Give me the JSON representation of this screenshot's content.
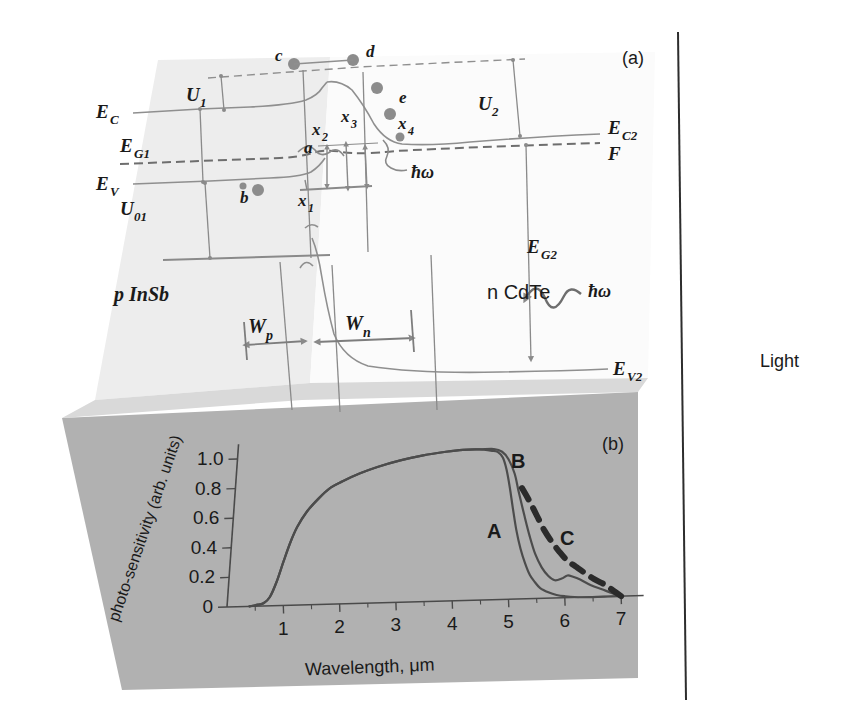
{
  "figure": {
    "panel_a_tag": "(a)",
    "panel_b_tag": "(b)",
    "light_label": "Light"
  },
  "band_diagram": {
    "material_left": "p InSb",
    "material_right": "n CdTe",
    "levels": [
      {
        "key": "EC",
        "label": "E",
        "sub": "C",
        "desc": "conduction-band-edge-left"
      },
      {
        "key": "EV",
        "label": "E",
        "sub": "V",
        "desc": "valence-band-edge-left"
      },
      {
        "key": "EC2",
        "label": "E",
        "sub": "C2",
        "desc": "conduction-band-edge-right"
      },
      {
        "key": "EV2",
        "label": "E",
        "sub": "V2",
        "desc": "valence-band-edge-right"
      },
      {
        "key": "F",
        "label": "F",
        "sub": "",
        "desc": "fermi-level"
      }
    ],
    "energies": [
      {
        "key": "EG1",
        "label": "E",
        "sub": "G1",
        "desc": "bandgap-left"
      },
      {
        "key": "EG2",
        "label": "E",
        "sub": "G2",
        "desc": "bandgap-right"
      }
    ],
    "potentials": [
      {
        "key": "U1",
        "label": "U",
        "sub": "1",
        "desc": "barrier-left"
      },
      {
        "key": "U2",
        "label": "U",
        "sub": "2",
        "desc": "barrier-right"
      },
      {
        "key": "U01",
        "label": "U",
        "sub": "01",
        "desc": "built-in-potential"
      }
    ],
    "widths": [
      {
        "key": "Wp",
        "label": "W",
        "sub": "p",
        "desc": "depletion-width-p-side"
      },
      {
        "key": "Wn",
        "label": "W",
        "sub": "n",
        "desc": "depletion-width-n-side"
      }
    ],
    "transitions": [
      {
        "key": "x1",
        "label": "x",
        "sub": "1"
      },
      {
        "key": "x2",
        "label": "x",
        "sub": "2"
      },
      {
        "key": "x3",
        "label": "x",
        "sub": "3"
      },
      {
        "key": "x4",
        "label": "x",
        "sub": "4"
      }
    ],
    "carriers": [
      {
        "key": "a",
        "label": "a"
      },
      {
        "key": "b",
        "label": "b"
      },
      {
        "key": "c",
        "label": "c"
      },
      {
        "key": "d",
        "label": "d"
      },
      {
        "key": "e",
        "label": "e"
      }
    ],
    "photon_label": "ħω",
    "photon_label_2": "ħω"
  },
  "chart_data": {
    "type": "line",
    "title": "",
    "xlabel": "Wavelength, μm",
    "ylabel": "photo-sensitivity (arb. units)",
    "xlim": [
      0,
      7.4
    ],
    "ylim": [
      0,
      1.1
    ],
    "xticks": [
      1,
      2,
      3,
      4,
      5,
      6,
      7
    ],
    "yticks": [
      0,
      0.2,
      0.4,
      0.6,
      0.8,
      1.0
    ],
    "xticklabels": [
      "1",
      "2",
      "3",
      "4",
      "5",
      "6",
      "7"
    ],
    "yticklabels": [
      "0",
      "0.2",
      "0.4",
      "0.6",
      "0.8",
      "1.0"
    ],
    "grid": false,
    "legend": "inline-annotations",
    "series": [
      {
        "name": "A",
        "style": "solid",
        "annotation": "A",
        "x": [
          0.4,
          0.55,
          0.65,
          0.75,
          0.85,
          0.95,
          1.05,
          1.15,
          1.3,
          1.5,
          1.7,
          1.9,
          2.2,
          2.5,
          2.9,
          3.3,
          3.7,
          4.0,
          4.3,
          4.5,
          4.62,
          4.72,
          4.8,
          4.88,
          4.96,
          5.05,
          5.15,
          5.25,
          5.35,
          5.45,
          5.55,
          5.7,
          5.85,
          6.0,
          6.3,
          6.7,
          7.0
        ],
        "y": [
          0.0,
          0.01,
          0.02,
          0.06,
          0.16,
          0.3,
          0.43,
          0.53,
          0.63,
          0.72,
          0.79,
          0.83,
          0.88,
          0.92,
          0.96,
          0.99,
          1.01,
          1.02,
          1.02,
          1.01,
          1.0,
          0.96,
          0.88,
          0.76,
          0.62,
          0.47,
          0.34,
          0.24,
          0.16,
          0.11,
          0.07,
          0.04,
          0.02,
          0.01,
          0.0,
          0.0,
          0.0
        ]
      },
      {
        "name": "B",
        "style": "solid",
        "annotation": "B",
        "x": [
          0.4,
          0.55,
          0.65,
          0.75,
          0.85,
          0.95,
          1.05,
          1.15,
          1.3,
          1.5,
          1.7,
          1.9,
          2.2,
          2.5,
          2.9,
          3.3,
          3.7,
          4.0,
          4.3,
          4.55,
          4.7,
          4.82,
          4.95,
          5.05,
          5.18,
          5.3,
          5.42,
          5.55,
          5.68,
          5.8,
          5.92,
          6.02,
          6.12,
          6.25,
          6.45,
          6.65,
          6.85,
          7.0
        ],
        "y": [
          0.0,
          0.01,
          0.02,
          0.06,
          0.16,
          0.3,
          0.43,
          0.53,
          0.63,
          0.72,
          0.79,
          0.83,
          0.88,
          0.92,
          0.96,
          0.99,
          1.01,
          1.02,
          1.02,
          1.02,
          1.0,
          0.95,
          0.85,
          0.72,
          0.56,
          0.42,
          0.3,
          0.21,
          0.15,
          0.12,
          0.13,
          0.15,
          0.14,
          0.12,
          0.08,
          0.05,
          0.02,
          0.0
        ]
      },
      {
        "name": "C",
        "style": "dashed",
        "annotation": "C",
        "x": [
          5.1,
          5.25,
          5.4,
          5.55,
          5.7,
          5.85,
          6.0,
          6.15,
          6.3,
          6.5,
          6.7,
          6.85,
          7.0
        ],
        "y": [
          0.75,
          0.66,
          0.56,
          0.46,
          0.38,
          0.31,
          0.25,
          0.21,
          0.17,
          0.12,
          0.08,
          0.04,
          0.0
        ]
      }
    ]
  },
  "colors": {
    "panel_a_fill": "#ededed",
    "panel_a_fill_light": "#f7f7f7",
    "panel_b_fill": "#b0b0b0",
    "panel_top_fill": "#d4d4d4",
    "curve": "#4c4c4c",
    "line": "#8a8a8a",
    "text": "#1a1a1a"
  }
}
